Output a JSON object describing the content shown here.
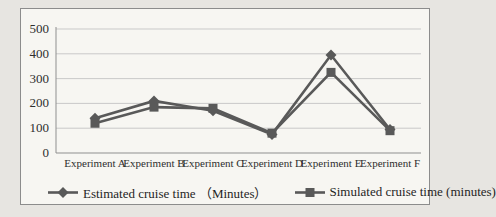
{
  "chart_data": {
    "type": "line",
    "title": "",
    "xlabel": "",
    "ylabel": "",
    "categories": [
      "Experiment A",
      "Experiment B",
      "Experiment C",
      "Experiment D",
      "Experiment E",
      "Experiment F"
    ],
    "series": [
      {
        "name": "Estimated cruise time （Minutes）",
        "marker": "diamond",
        "values": [
          140,
          210,
          170,
          75,
          395,
          95
        ]
      },
      {
        "name": "Simulated cruise time (minutes)",
        "marker": "square",
        "values": [
          120,
          185,
          180,
          80,
          325,
          90
        ]
      }
    ],
    "ylim": [
      0,
      500
    ],
    "yticks": [
      0,
      100,
      200,
      300,
      400,
      500
    ],
    "grid": "horizontal",
    "legend_position": "bottom",
    "colors": {
      "line": "#595959",
      "grid": "#c9c9c9",
      "axis": "#8f8f8f",
      "text": "#2e2e2e",
      "frame_bg": "#f7f6f2",
      "frame_border": "#8c8c8c",
      "page_bg": "#e7e5e1"
    }
  }
}
